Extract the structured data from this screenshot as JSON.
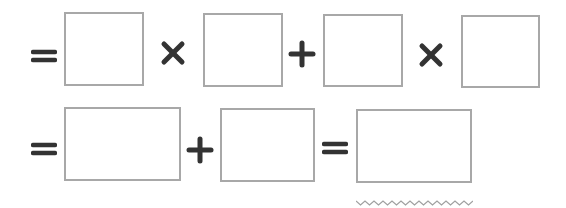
{
  "worksheet": {
    "rows": [
      {
        "items": [
          {
            "type": "operator",
            "symbol": "=",
            "name": "equals"
          },
          {
            "type": "blank",
            "value": ""
          },
          {
            "type": "operator",
            "symbol": "×",
            "name": "times"
          },
          {
            "type": "blank",
            "value": ""
          },
          {
            "type": "operator",
            "symbol": "+",
            "name": "plus"
          },
          {
            "type": "blank",
            "value": ""
          },
          {
            "type": "operator",
            "symbol": "×",
            "name": "times"
          },
          {
            "type": "blank",
            "value": ""
          }
        ]
      },
      {
        "items": [
          {
            "type": "operator",
            "symbol": "=",
            "name": "equals"
          },
          {
            "type": "blank",
            "value": ""
          },
          {
            "type": "operator",
            "symbol": "+",
            "name": "plus"
          },
          {
            "type": "blank",
            "value": ""
          },
          {
            "type": "operator",
            "symbol": "=",
            "name": "equals"
          },
          {
            "type": "blank",
            "value": "",
            "underline": "wavy"
          }
        ]
      }
    ],
    "colors": {
      "operator": "#333333",
      "box_border": "#a8a8a8",
      "wavy_underline": "#a0a0a0",
      "background": "#ffffff"
    }
  }
}
